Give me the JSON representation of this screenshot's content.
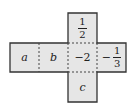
{
  "diagram": {
    "type": "cube-net",
    "faces": {
      "top": {
        "kind": "fraction",
        "numerator": "1",
        "denominator": "2"
      },
      "left1": {
        "kind": "variable",
        "text": "a"
      },
      "left2": {
        "kind": "variable",
        "text": "b"
      },
      "center": {
        "kind": "number",
        "text": "−2"
      },
      "right": {
        "kind": "fraction",
        "sign": "−",
        "numerator": "1",
        "denominator": "3"
      },
      "bottom": {
        "kind": "variable",
        "text": "c"
      }
    },
    "colors": {
      "fill": "#e6e6e6",
      "stroke": "#333333"
    }
  }
}
